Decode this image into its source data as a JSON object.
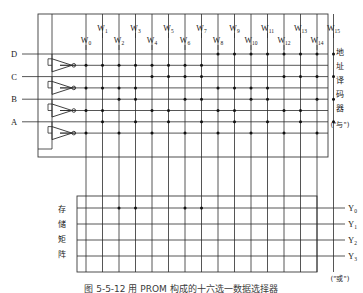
{
  "figure": {
    "caption": "图 5-5-12  用 PROM 构成的十六选一数据选择器"
  },
  "inputs": [
    {
      "id": "D",
      "label": "D"
    },
    {
      "id": "C",
      "label": "C"
    },
    {
      "id": "B",
      "label": "B"
    },
    {
      "id": "A",
      "label": "A"
    }
  ],
  "word_lines": [
    {
      "label": "W",
      "sub": "0"
    },
    {
      "label": "W",
      "sub": "1"
    },
    {
      "label": "W",
      "sub": "2"
    },
    {
      "label": "W",
      "sub": "3"
    },
    {
      "label": "W",
      "sub": "4"
    },
    {
      "label": "W",
      "sub": "5"
    },
    {
      "label": "W",
      "sub": "6"
    },
    {
      "label": "W",
      "sub": "7"
    },
    {
      "label": "W",
      "sub": "8"
    },
    {
      "label": "W",
      "sub": "9"
    },
    {
      "label": "W",
      "sub": "10"
    },
    {
      "label": "W",
      "sub": "11"
    },
    {
      "label": "W",
      "sub": "12"
    },
    {
      "label": "W",
      "sub": "13"
    },
    {
      "label": "W",
      "sub": "14"
    },
    {
      "label": "W",
      "sub": "15"
    }
  ],
  "outputs": [
    {
      "label": "Y",
      "sub": "0"
    },
    {
      "label": "Y",
      "sub": "1"
    },
    {
      "label": "Y",
      "sub": "2"
    },
    {
      "label": "Y",
      "sub": "3"
    }
  ],
  "decoder_block": {
    "name": "address-decoder",
    "chars": [
      "地",
      "址",
      "译",
      "码",
      "器"
    ],
    "gate_note": "(\"与\")"
  },
  "storage_block": {
    "name": "storage-matrix",
    "chars": [
      "存",
      "储",
      "矩",
      "阵"
    ],
    "gate_note": "(\"或\")"
  },
  "and_rows": [
    {
      "var": "D",
      "complement": false
    },
    {
      "var": "D",
      "complement": true
    },
    {
      "var": "C",
      "complement": false
    },
    {
      "var": "C",
      "complement": true
    },
    {
      "var": "B",
      "complement": false
    },
    {
      "var": "B",
      "complement": true
    },
    {
      "var": "A",
      "complement": false
    },
    {
      "var": "A",
      "complement": true
    }
  ],
  "and_matrix_dots": [
    [
      1,
      3,
      5,
      7
    ],
    [
      1,
      3,
      5,
      6
    ],
    [
      1,
      3,
      4,
      7
    ],
    [
      1,
      3,
      4,
      6
    ],
    [
      1,
      2,
      5,
      7
    ],
    [
      1,
      2,
      5,
      6
    ],
    [
      1,
      2,
      4,
      7
    ],
    [
      1,
      2,
      4,
      6
    ],
    [
      0,
      3,
      5,
      7
    ],
    [
      0,
      3,
      5,
      6
    ],
    [
      0,
      3,
      4,
      7
    ],
    [
      0,
      3,
      4,
      6
    ],
    [
      0,
      2,
      5,
      7
    ],
    [
      0,
      2,
      5,
      6
    ],
    [
      0,
      2,
      4,
      7
    ],
    [
      0,
      2,
      4,
      6
    ]
  ],
  "or_matrix_dots": [
    {
      "output": 0,
      "words": [
        2,
        3,
        6,
        7
      ]
    },
    {
      "output": 1,
      "words": []
    },
    {
      "output": 2,
      "words": []
    },
    {
      "output": 3,
      "words": []
    }
  ],
  "colors": {
    "line": "#2b2b2b",
    "dot": "#111111",
    "frame": "#3a3a3a",
    "background": "#ffffff"
  },
  "chart_data": {
    "type": "diagram",
    "diagram_kind": "PROM logic schematic",
    "and_plane_rows": 8,
    "and_plane_cols": 16,
    "or_plane_rows": 4,
    "or_plane_cols": 16
  }
}
